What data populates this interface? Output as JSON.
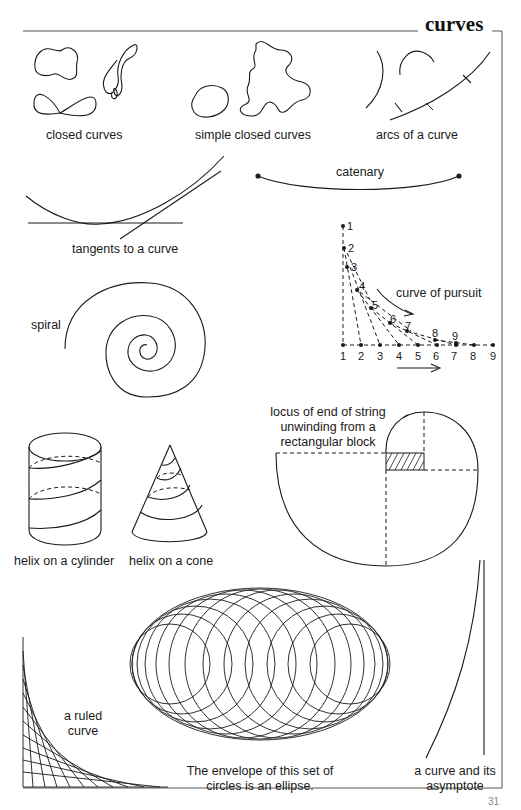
{
  "page": {
    "title": "curves",
    "page_number": "31"
  },
  "labels": {
    "closed_curves": "closed curves",
    "simple_closed_curves": "simple closed curves",
    "arcs_of_a_curve": "arcs of a curve",
    "catenary": "catenary",
    "tangents": "tangents to a curve",
    "spiral": "spiral",
    "curve_of_pursuit": "curve of pursuit",
    "locus_line1": "locus of end of string",
    "locus_line2": "unwinding from a",
    "locus_line3": "rectangular block",
    "helix_cylinder": "helix on a cylinder",
    "helix_cone": "helix on a cone",
    "ruled_line1": "a ruled",
    "ruled_line2": "curve",
    "envelope_line1": "The envelope of this set of",
    "envelope_line2": "circles is an ellipse.",
    "asymptote_line1": "a curve and its",
    "asymptote_line2": "asymptote"
  },
  "pursuit": {
    "pursuer_numbers": [
      "1",
      "2",
      "3",
      "4",
      "5",
      "6",
      "7",
      "8",
      "9"
    ],
    "target_numbers": [
      "1",
      "2",
      "3",
      "4",
      "5",
      "6",
      "7",
      "8",
      "9"
    ]
  },
  "colors": {
    "ink": "#1a1a1a",
    "frame": "#555555",
    "background": "#ffffff"
  }
}
